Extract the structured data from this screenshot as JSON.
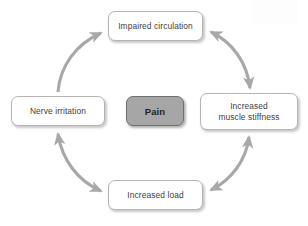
{
  "diagram": {
    "background_color": "#ffffff",
    "arrow_color": "#a8a8a8",
    "node_border_color": "#b4b4b4",
    "node_text_color": "#404040",
    "center_fill_color": "#a6a6a6",
    "center_border_color": "#6f6f6f",
    "nodes": [
      {
        "id": "impaired-circulation",
        "label": "Impaired circulation",
        "position": "top"
      },
      {
        "id": "increased-muscle-stiffness",
        "label": "Increased\nmuscle stiffness",
        "position": "right"
      },
      {
        "id": "increased-load",
        "label": "Increased load",
        "position": "bottom"
      },
      {
        "id": "nerve-irritation",
        "label": "Nerve irritation",
        "position": "left"
      },
      {
        "id": "pain",
        "label": "Pain",
        "position": "center"
      }
    ],
    "arrows": [
      {
        "id": "nerve-irritation-to-impaired-circulation",
        "from": "nerve-irritation",
        "to": "impaired-circulation",
        "heads": "single"
      },
      {
        "id": "impaired-circulation-to-increased-muscle-stiffness",
        "from": "impaired-circulation",
        "to": "increased-muscle-stiffness",
        "heads": "double"
      },
      {
        "id": "increased-muscle-stiffness-to-increased-load",
        "from": "increased-muscle-stiffness",
        "to": "increased-load",
        "heads": "double"
      },
      {
        "id": "increased-load-to-nerve-irritation",
        "from": "increased-load",
        "to": "nerve-irritation",
        "heads": "double"
      }
    ]
  }
}
